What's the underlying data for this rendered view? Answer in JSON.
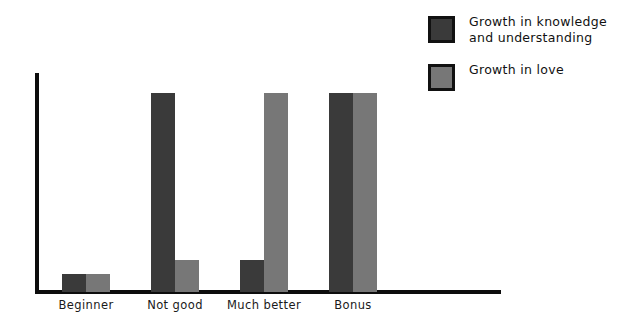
{
  "chart_data": {
    "type": "bar",
    "title": "",
    "xlabel": "",
    "ylabel": "",
    "grid": false,
    "legend_position": "top-right",
    "ylim": [
      0,
      110
    ],
    "categories": [
      "Beginner",
      "Not good",
      "Much better",
      "Bonus"
    ],
    "series": [
      {
        "name": "Growth in knowledge and understanding",
        "color": "#3a3a3a",
        "values": [
          9,
          100,
          16,
          100
        ]
      },
      {
        "name": "Growth in love",
        "color": "#777777",
        "values": [
          9,
          16,
          100,
          100
        ]
      }
    ]
  },
  "legend": {
    "items": [
      {
        "label": "Growth in knowledge\nand understanding",
        "color": "#3a3a3a"
      },
      {
        "label": "Growth in love",
        "color": "#777777"
      }
    ]
  },
  "axis": {
    "line_color": "#0d0d0d"
  }
}
